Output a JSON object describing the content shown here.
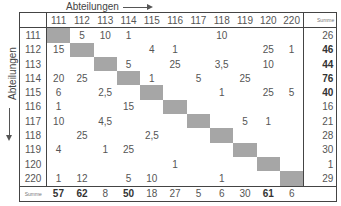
{
  "labels": {
    "column_axis": "Abteilungen",
    "row_axis": "Abteilungen",
    "sum_label": "Summe"
  },
  "chart_data": {
    "type": "table",
    "title": "",
    "xlabel": "Abteilungen",
    "ylabel": "Abteilungen",
    "columns": [
      "111",
      "112",
      "113",
      "114",
      "115",
      "116",
      "117",
      "118",
      "119",
      "120",
      "220"
    ],
    "rows": [
      {
        "label": "111",
        "values": [
          "",
          "5",
          "10",
          "1",
          "",
          "",
          "",
          "10",
          "",
          "",
          ""
        ],
        "sum": "26",
        "sum_bold": false
      },
      {
        "label": "112",
        "values": [
          "15",
          "",
          "",
          "",
          "4",
          "1",
          "",
          "",
          "",
          "25",
          "1"
        ],
        "sum": "46",
        "sum_bold": true
      },
      {
        "label": "113",
        "values": [
          "",
          "",
          "",
          "5",
          "",
          "25",
          "",
          "3,5",
          "",
          "10",
          ""
        ],
        "sum": "44",
        "sum_bold": true
      },
      {
        "label": "114",
        "values": [
          "20",
          "25",
          "",
          "",
          "1",
          "",
          "5",
          "",
          "25",
          "",
          ""
        ],
        "sum": "76",
        "sum_bold": true
      },
      {
        "label": "115",
        "values": [
          "6",
          "",
          "2,5",
          "",
          "",
          "",
          "",
          "1",
          "",
          "25",
          "5"
        ],
        "sum": "40",
        "sum_bold": true
      },
      {
        "label": "116",
        "values": [
          "1",
          "",
          "",
          "15",
          "",
          "",
          "",
          "",
          "",
          "",
          ""
        ],
        "sum": "16",
        "sum_bold": false
      },
      {
        "label": "117",
        "values": [
          "10",
          "",
          "4,5",
          "",
          "",
          "",
          "",
          "",
          "5",
          "1",
          ""
        ],
        "sum": "21",
        "sum_bold": false
      },
      {
        "label": "118",
        "values": [
          "",
          "25",
          "",
          "",
          "2,5",
          "",
          "",
          "",
          "",
          "",
          ""
        ],
        "sum": "28",
        "sum_bold": false
      },
      {
        "label": "119",
        "values": [
          "4",
          "",
          "1",
          "25",
          "",
          "",
          "",
          "",
          "",
          "",
          ""
        ],
        "sum": "30",
        "sum_bold": false
      },
      {
        "label": "120",
        "values": [
          "",
          "",
          "",
          "",
          "",
          "1",
          "",
          "",
          "",
          "",
          ""
        ],
        "sum": "1",
        "sum_bold": false
      },
      {
        "label": "220",
        "values": [
          "1",
          "12",
          "",
          "5",
          "10",
          "",
          "",
          "1",
          "",
          "",
          ""
        ],
        "sum": "29",
        "sum_bold": false
      }
    ],
    "column_sums": [
      {
        "value": "57",
        "bold": true
      },
      {
        "value": "62",
        "bold": true
      },
      {
        "value": "8",
        "bold": false
      },
      {
        "value": "50",
        "bold": true
      },
      {
        "value": "18",
        "bold": false
      },
      {
        "value": "27",
        "bold": false
      },
      {
        "value": "5",
        "bold": false
      },
      {
        "value": "6",
        "bold": false
      },
      {
        "value": "30",
        "bold": false
      },
      {
        "value": "61",
        "bold": true
      },
      {
        "value": "6",
        "bold": false
      }
    ],
    "diagonal_shaded": true,
    "diagonal_color": "#a6a6a6"
  }
}
